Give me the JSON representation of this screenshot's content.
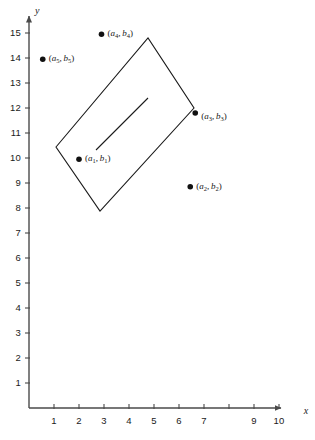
{
  "figure": {
    "background_color": "#ffffff",
    "line_color": "#1a1a1a",
    "axis_color": "#4a4a4a"
  },
  "axes": {
    "x_axis_label": "x",
    "y_axis_label": "y",
    "x_ticks": [
      {
        "value": 1,
        "label": "1"
      },
      {
        "value": 2,
        "label": "2"
      },
      {
        "value": 3,
        "label": "3"
      },
      {
        "value": 4,
        "label": "4"
      },
      {
        "value": 5,
        "label": "5"
      },
      {
        "value": 6,
        "label": "6"
      },
      {
        "value": 7,
        "label": "7"
      },
      {
        "value": 8,
        "label": ""
      },
      {
        "value": 9,
        "label": "9"
      },
      {
        "value": 10,
        "label": "10"
      }
    ],
    "y_ticks": [
      {
        "value": 1,
        "label": "1"
      },
      {
        "value": 2,
        "label": "2"
      },
      {
        "value": 3,
        "label": "3"
      },
      {
        "value": 4,
        "label": "4"
      },
      {
        "value": 5,
        "label": "5"
      },
      {
        "value": 6,
        "label": "6"
      },
      {
        "value": 7,
        "label": "7"
      },
      {
        "value": 8,
        "label": "8"
      },
      {
        "value": 9,
        "label": "9"
      },
      {
        "value": 10,
        "label": "10"
      },
      {
        "value": 11,
        "label": "11"
      },
      {
        "value": 12,
        "label": "12"
      },
      {
        "value": 13,
        "label": "13"
      },
      {
        "value": 14,
        "label": "14"
      },
      {
        "value": 15,
        "label": "15"
      }
    ]
  },
  "chart_data": {
    "type": "scatter",
    "title": "",
    "xlabel": "x",
    "ylabel": "y",
    "xlim": [
      0,
      10.8
    ],
    "ylim": [
      0,
      15.6
    ],
    "grid": false,
    "legend": false,
    "points": [
      {
        "name": "p1",
        "label_a": "a",
        "label_b": "b",
        "sub": "1",
        "x": 2.0,
        "y": 9.95,
        "label_dx": 6,
        "label_dy": 4
      },
      {
        "name": "p2",
        "label_a": "a",
        "label_b": "b",
        "sub": "2",
        "x": 6.45,
        "y": 8.85,
        "label_dx": 6,
        "label_dy": 4
      },
      {
        "name": "p3",
        "label_a": "a",
        "label_b": "b",
        "sub": "3",
        "x": 6.65,
        "y": 11.8,
        "label_dx": 6,
        "label_dy": 8
      },
      {
        "name": "p4",
        "label_a": "a",
        "label_b": "b",
        "sub": "4",
        "x": 2.9,
        "y": 14.95,
        "label_dx": 6,
        "label_dy": 4
      },
      {
        "name": "p5",
        "label_a": "a",
        "label_b": "b",
        "sub": "5",
        "x": 0.55,
        "y": 13.95,
        "label_dx": 6,
        "label_dy": 4
      }
    ],
    "region_polygon": {
      "name": "rotated-rectangle",
      "vertices": [
        {
          "x": 1.08,
          "y": 10.44
        },
        {
          "x": 4.76,
          "y": 14.8
        },
        {
          "x": 6.6,
          "y": 12.0
        },
        {
          "x": 2.84,
          "y": 7.88
        }
      ]
    },
    "interior_segment": {
      "name": "interior-diagonal",
      "start": {
        "x": 2.68,
        "y": 10.32
      },
      "end": {
        "x": 4.76,
        "y": 12.4
      }
    }
  }
}
